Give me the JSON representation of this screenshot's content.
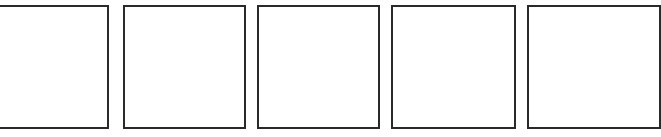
{
  "panels": [
    {
      "label": ""
    },
    {
      "label": ""
    },
    {
      "label": ""
    },
    {
      "label": ""
    },
    {
      "label": ""
    }
  ],
  "colors": {
    "border": "#2a2a2a",
    "background": "#ffffff"
  }
}
